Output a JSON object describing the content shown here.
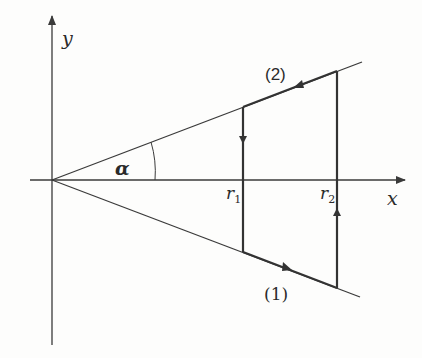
{
  "diagram": {
    "axes": {
      "x_label": "x",
      "y_label": "y"
    },
    "angle_label": "α",
    "radii": {
      "r1": "r",
      "r1_sub": "1",
      "r2": "r",
      "r2_sub": "2"
    },
    "paths": {
      "upper": "(2)",
      "lower": "(1)"
    },
    "colors": {
      "stroke": "#3a3a3a",
      "background": "#fdfdfc"
    }
  }
}
